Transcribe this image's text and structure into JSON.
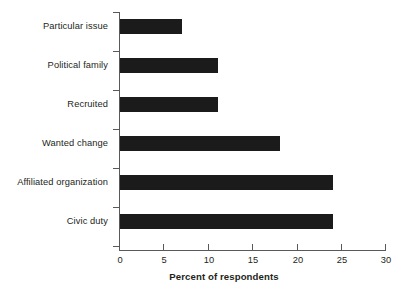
{
  "chart_data": {
    "type": "bar",
    "orientation": "horizontal",
    "title": "",
    "xlabel": "Percent of respondents",
    "ylabel": "",
    "categories": [
      "Particular issue",
      "Political family",
      "Recruited",
      "Wanted change",
      "Affiliated organization",
      "Civic duty"
    ],
    "values": [
      7,
      11,
      11,
      18,
      24,
      24
    ],
    "xlim": [
      0,
      30
    ],
    "xticks": [
      0,
      5,
      10,
      15,
      20,
      25,
      30
    ],
    "xtick_labels": [
      "0",
      "5",
      "10",
      "15",
      "20",
      "25",
      "30"
    ],
    "grid": false,
    "legend": false,
    "bar_color": "#1b1b1b",
    "axis_color": "#58595b",
    "text_color": "#231f20",
    "background": "#ffffff"
  }
}
